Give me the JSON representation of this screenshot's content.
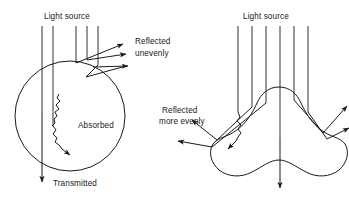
{
  "figure": {
    "title": "",
    "background_color": "#ffffff",
    "line_color": "#1a1a1a",
    "text_color": "#1a1a1a"
  },
  "panels": [
    {
      "id": "smooth-sphere-panel",
      "name": "smooth-spherical-particle",
      "shape": "circle",
      "labels": {
        "light_source": "Light source",
        "reflected": "Reflected",
        "reflected_qualifier": "unevenly",
        "absorbed": "Absorbed",
        "transmitted": "Transmitted"
      },
      "incident_ray_count": 5,
      "reflected_ray_count": 4,
      "transmitted_ray_count": 1,
      "absorbed_ray_count": 1
    },
    {
      "id": "rough-blob-panel",
      "name": "irregular-rough-particle",
      "shape": "irregular-blob",
      "labels": {
        "light_source": "Light source",
        "reflected": "Reflected",
        "reflected_qualifier": "more evenly"
      },
      "incident_ray_count": 6,
      "reflected_ray_count": 4,
      "transmitted_ray_count": 1,
      "absorbed_ray_count": 1
    }
  ]
}
